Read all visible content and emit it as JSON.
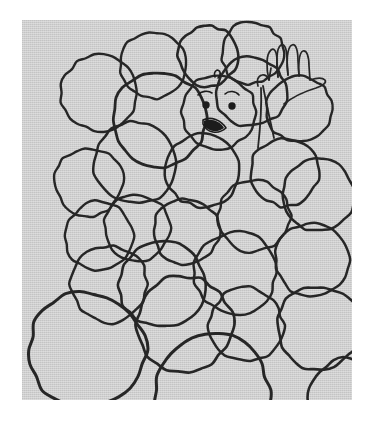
{
  "figure": {
    "caption": "",
    "canvas": {
      "width": 374,
      "height": 428
    },
    "panel": {
      "x": 22,
      "y": 20,
      "width": 330,
      "height": 380
    }
  },
  "colors": {
    "page_background": "#ffffff",
    "panel_background": "#cfcfcf",
    "ink": "#262626",
    "face_ink": "#1c1c1c"
  },
  "drawing": {
    "style": "hand-drawn-line-art",
    "subject": "packed circles / balls of varying sizes",
    "ball_count": 27,
    "balls": [
      {
        "id": "ball-01",
        "cx": 77,
        "cy": 73,
        "r": 38,
        "stroke_width": 2.4,
        "wobble": 1.6
      },
      {
        "id": "ball-02",
        "cx": 131,
        "cy": 45,
        "r": 33,
        "stroke_width": 2.4,
        "wobble": 1.5
      },
      {
        "id": "ball-03",
        "cx": 186,
        "cy": 36,
        "r": 30,
        "stroke_width": 2.6,
        "wobble": 1.4
      },
      {
        "id": "ball-04",
        "cx": 137,
        "cy": 100,
        "r": 47,
        "stroke_width": 2.8,
        "wobble": 1.9
      },
      {
        "id": "ball-05",
        "cx": 196,
        "cy": 92,
        "r": 37,
        "stroke_width": 2.4,
        "wobble": 1.5
      },
      {
        "id": "ball-06",
        "cx": 230,
        "cy": 33,
        "r": 31,
        "stroke_width": 2.4,
        "wobble": 1.5
      },
      {
        "id": "ball-07",
        "cx": 229,
        "cy": 72,
        "r": 35,
        "stroke_width": 2.5,
        "wobble": 1.6
      },
      {
        "id": "ball-08",
        "cx": 277,
        "cy": 89,
        "r": 33,
        "stroke_width": 2.4,
        "wobble": 1.5
      },
      {
        "id": "ball-09",
        "cx": 113,
        "cy": 143,
        "r": 41,
        "stroke_width": 2.5,
        "wobble": 1.7
      },
      {
        "id": "ball-10",
        "cx": 180,
        "cy": 150,
        "r": 37,
        "stroke_width": 2.5,
        "wobble": 1.6
      },
      {
        "id": "ball-11",
        "cx": 263,
        "cy": 152,
        "r": 34,
        "stroke_width": 2.5,
        "wobble": 1.6
      },
      {
        "id": "ball-12",
        "cx": 67,
        "cy": 162,
        "r": 34,
        "stroke_width": 2.4,
        "wobble": 1.5
      },
      {
        "id": "ball-13",
        "cx": 115,
        "cy": 208,
        "r": 33,
        "stroke_width": 2.4,
        "wobble": 1.5
      },
      {
        "id": "ball-14",
        "cx": 164,
        "cy": 211,
        "r": 33,
        "stroke_width": 2.5,
        "wobble": 1.5
      },
      {
        "id": "ball-15",
        "cx": 232,
        "cy": 196,
        "r": 36,
        "stroke_width": 2.4,
        "wobble": 1.5
      },
      {
        "id": "ball-16",
        "cx": 77,
        "cy": 216,
        "r": 34,
        "stroke_width": 2.4,
        "wobble": 1.5
      },
      {
        "id": "ball-17",
        "cx": 296,
        "cy": 175,
        "r": 36,
        "stroke_width": 2.5,
        "wobble": 1.6
      },
      {
        "id": "ball-18",
        "cx": 140,
        "cy": 265,
        "r": 43,
        "stroke_width": 2.6,
        "wobble": 1.8
      },
      {
        "id": "ball-19",
        "cx": 213,
        "cy": 253,
        "r": 41,
        "stroke_width": 2.5,
        "wobble": 1.7
      },
      {
        "id": "ball-20",
        "cx": 87,
        "cy": 264,
        "r": 38,
        "stroke_width": 2.5,
        "wobble": 1.7
      },
      {
        "id": "ball-21",
        "cx": 290,
        "cy": 240,
        "r": 37,
        "stroke_width": 2.5,
        "wobble": 1.6
      },
      {
        "id": "ball-22",
        "cx": 297,
        "cy": 308,
        "r": 42,
        "stroke_width": 2.6,
        "wobble": 1.8
      },
      {
        "id": "ball-23",
        "cx": 65,
        "cy": 330,
        "r": 58,
        "stroke_width": 3.0,
        "wobble": 2.2
      },
      {
        "id": "ball-24",
        "cx": 162,
        "cy": 304,
        "r": 48,
        "stroke_width": 2.7,
        "wobble": 1.9
      },
      {
        "id": "ball-25",
        "cx": 224,
        "cy": 305,
        "r": 37,
        "stroke_width": 2.5,
        "wobble": 1.7
      },
      {
        "id": "ball-26",
        "cx": 190,
        "cy": 370,
        "r": 57,
        "stroke_width": 3.0,
        "wobble": 2.2
      },
      {
        "id": "ball-27",
        "cx": 326,
        "cy": 378,
        "r": 40,
        "stroke_width": 2.6,
        "wobble": 1.8
      }
    ],
    "face": {
      "label": "smiling-face-ball",
      "cx": 196,
      "cy": 92,
      "r": 37,
      "tuft": "small curl on top of head",
      "left_eye": {
        "cx": 184,
        "cy": 84,
        "r": 3.6
      },
      "right_eye": {
        "cx": 210,
        "cy": 85,
        "r": 3.6
      },
      "left_brow": "short arc above left eye",
      "right_brow": "short arc above right eye",
      "mouth": "open smile wedge, filled dark"
    },
    "hand": {
      "label": "waving-hand",
      "fingers": 4,
      "thumb": 1,
      "description": "zigzag looped fingers above an open palm, raised in a wave"
    },
    "arm": {
      "label": "arm",
      "description": "single line from the hand sloping down-left into the pile of balls"
    }
  }
}
